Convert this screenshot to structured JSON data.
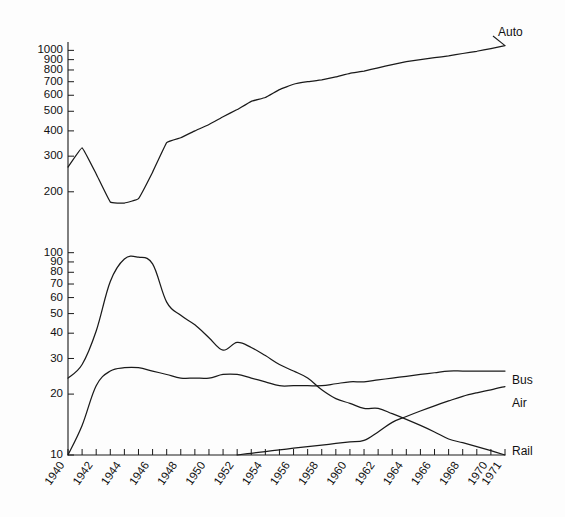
{
  "chart_data": {
    "type": "line",
    "title": "",
    "subtitle": "",
    "xlabel": "",
    "ylabel": "",
    "yscale": "log",
    "ylim": [
      10,
      1100
    ],
    "xlim": [
      1940,
      1971
    ],
    "grid": false,
    "legend_position": "right-inline-labels",
    "x_tick_labels": [
      "1940",
      "1942",
      "1944",
      "1946",
      "1948",
      "1950",
      "1952",
      "1954",
      "1956",
      "1958",
      "1960",
      "1962",
      "1964",
      "1966",
      "1968",
      "1970",
      "1971"
    ],
    "x_tick_values": [
      1940,
      1942,
      1944,
      1946,
      1948,
      1950,
      1952,
      1954,
      1956,
      1958,
      1960,
      1962,
      1964,
      1966,
      1968,
      1970,
      1971
    ],
    "y_tick_labels": [
      "10",
      "20",
      "30",
      "40",
      "50",
      "60",
      "70",
      "80",
      "90",
      "100",
      "200",
      "300",
      "400",
      "500",
      "600",
      "700",
      "800",
      "900",
      "1000"
    ],
    "y_tick_values": [
      10,
      20,
      30,
      40,
      50,
      60,
      70,
      80,
      90,
      100,
      200,
      300,
      400,
      500,
      600,
      700,
      800,
      900,
      1000
    ],
    "x": [
      1940,
      1941,
      1942,
      1943,
      1944,
      1945,
      1946,
      1947,
      1948,
      1949,
      1950,
      1951,
      1952,
      1953,
      1954,
      1955,
      1956,
      1957,
      1958,
      1959,
      1960,
      1961,
      1962,
      1963,
      1964,
      1965,
      1966,
      1967,
      1968,
      1969,
      1970,
      1971
    ],
    "series": [
      {
        "name": "Auto",
        "label": "Auto",
        "values": [
          265,
          330,
          245,
          178,
          176,
          185,
          250,
          350,
          370,
          400,
          430,
          470,
          510,
          560,
          585,
          640,
          680,
          700,
          715,
          740,
          770,
          790,
          820,
          850,
          880,
          900,
          920,
          940,
          965,
          990,
          1020,
          1055
        ]
      },
      {
        "name": "Rail",
        "label": "Rail",
        "values": [
          24,
          28,
          41,
          72,
          93,
          95,
          88,
          57,
          49,
          44,
          38,
          33,
          36,
          34,
          31,
          28,
          26,
          24,
          21,
          19,
          18,
          17,
          17,
          16,
          15,
          14,
          13,
          12,
          11.5,
          11,
          10.5,
          10
        ]
      },
      {
        "name": "Bus",
        "label": "Bus",
        "values": [
          10,
          14,
          22,
          26,
          27,
          27,
          26,
          25,
          24,
          24,
          24,
          25,
          25,
          24,
          23,
          22,
          22,
          22,
          22,
          22.5,
          23,
          23,
          23.5,
          24,
          24.5,
          25,
          25.5,
          26,
          26,
          26,
          26,
          26
        ]
      },
      {
        "name": "Air",
        "label": "Air",
        "values": [
          null,
          null,
          null,
          null,
          null,
          null,
          null,
          null,
          null,
          null,
          null,
          null,
          10,
          10.2,
          10.4,
          10.6,
          10.8,
          11,
          11.2,
          11.4,
          11.6,
          11.8,
          13,
          14.5,
          15.5,
          16.5,
          17.5,
          18.5,
          19.5,
          20.3,
          21,
          21.8
        ]
      }
    ]
  },
  "labels": {
    "auto": "Auto",
    "bus": "Bus",
    "air": "Air",
    "rail": "Rail"
  },
  "colors": {
    "line": "#1a1a1a",
    "background": "#fdfdfd",
    "text": "#111111"
  }
}
